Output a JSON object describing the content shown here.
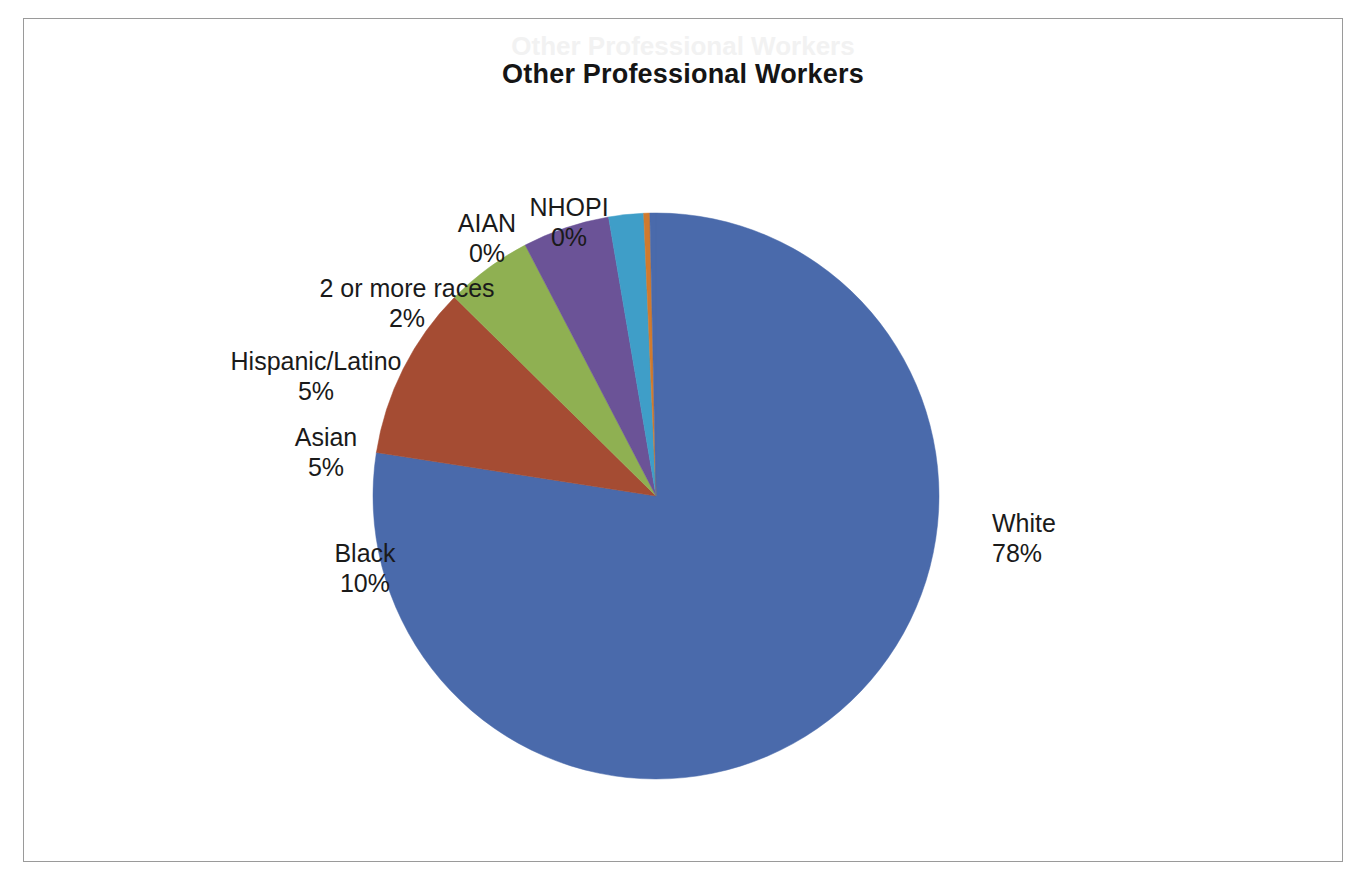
{
  "chart": {
    "title": "Other Professional Workers",
    "ghost_title": "Other Professional Workers"
  },
  "labels": {
    "white": {
      "name": "White",
      "pct": "78%"
    },
    "black": {
      "name": "Black",
      "pct": "10%"
    },
    "asian": {
      "name": "Asian",
      "pct": "5%"
    },
    "hispanic": {
      "name": "Hispanic/Latino",
      "pct": "5%"
    },
    "two_or_more": {
      "name": "2 or more races",
      "pct": "2%"
    },
    "aian": {
      "name": "AIAN",
      "pct": "0%"
    },
    "nhopi": {
      "name": "NHOPI",
      "pct": "0%"
    }
  },
  "chart_data": {
    "type": "pie",
    "title": "Other Professional Workers",
    "xlabel": "",
    "ylabel": "",
    "legend": "none",
    "data_labels": "category name and percent, outside slices",
    "start_angle_deg": 0,
    "direction": "clockwise",
    "categories": [
      "White",
      "Black",
      "Asian",
      "Hispanic/Latino",
      "2 or more races",
      "AIAN",
      "NHOPI"
    ],
    "values": [
      78,
      10,
      5,
      5,
      2,
      0,
      0
    ],
    "value_unit": "percent",
    "colors": [
      "#4a6aab",
      "#a54c33",
      "#8fb052",
      "#6b5397",
      "#3f9ec8",
      "#d07a2e",
      "#4a6aab"
    ],
    "slices": [
      {
        "label": "White",
        "value": 78,
        "display": "78%",
        "color": "#4a6aab"
      },
      {
        "label": "Black",
        "value": 10,
        "display": "10%",
        "color": "#a54c33"
      },
      {
        "label": "Asian",
        "value": 5,
        "display": "5%",
        "color": "#8fb052"
      },
      {
        "label": "Hispanic/Latino",
        "value": 5,
        "display": "5%",
        "color": "#6b5397"
      },
      {
        "label": "2 or more races",
        "value": 2,
        "display": "2%",
        "color": "#3f9ec8"
      },
      {
        "label": "AIAN",
        "value": 0,
        "display": "0%",
        "color": "#d07a2e"
      },
      {
        "label": "NHOPI",
        "value": 0,
        "display": "0%",
        "color": "#4a6aab"
      }
    ]
  }
}
